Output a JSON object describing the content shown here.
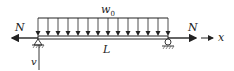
{
  "diagram": {
    "type": "beam-loading",
    "labels": {
      "load": "w",
      "load_subscript": "0",
      "axial_left": "N",
      "axial_right": "N",
      "length": "L",
      "x_axis": "x",
      "deflection": "v"
    },
    "load": {
      "arrow_count": 14,
      "x_start": 38,
      "x_end": 168
    },
    "supports": {
      "left": "pin",
      "right": "roller"
    },
    "colors": {
      "line": "#222222",
      "background": "#ffffff"
    }
  }
}
